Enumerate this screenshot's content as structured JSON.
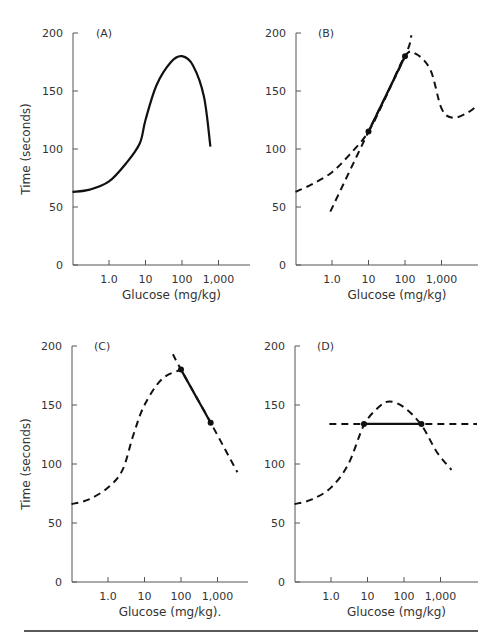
{
  "chart_data": [
    {
      "type": "line",
      "panel": "A",
      "title": "(A)",
      "xlabel": "Glucose (mg/kg)",
      "ylabel": "Time (seconds)",
      "xscale": "log",
      "xticks": [
        "1.0",
        "10",
        "100",
        "1,000"
      ],
      "yticks": [
        0,
        50,
        100,
        150,
        200
      ],
      "ylim": [
        0,
        200
      ],
      "grid": false,
      "series": [
        {
          "name": "dose-response",
          "style": "solid",
          "x": [
            0.1,
            0.3,
            1.0,
            3.0,
            7.0,
            10,
            20,
            50,
            100,
            200,
            400,
            600
          ],
          "y": [
            63,
            65,
            72,
            88,
            105,
            125,
            155,
            175,
            180,
            172,
            145,
            102
          ]
        }
      ]
    },
    {
      "type": "line",
      "panel": "B",
      "title": "(B)",
      "xlabel": "Glucose (mg/kg)",
      "ylabel": "",
      "xscale": "log",
      "xticks": [
        "1.0",
        "10",
        "100",
        "1,000"
      ],
      "yticks": [
        0,
        50,
        100,
        150,
        200
      ],
      "ylim": [
        0,
        200
      ],
      "grid": false,
      "series": [
        {
          "name": "curve",
          "style": "dashed",
          "x": [
            0.1,
            0.3,
            1.0,
            3.0,
            10,
            30,
            100,
            200,
            500,
            1000,
            2000,
            5000,
            10000
          ],
          "y": [
            63,
            70,
            80,
            95,
            115,
            145,
            180,
            182,
            168,
            135,
            127,
            131,
            138
          ]
        },
        {
          "name": "tangent-extension",
          "style": "dashed",
          "x": [
            0.9,
            10,
            100,
            150
          ],
          "y": [
            46,
            115,
            180,
            198
          ]
        },
        {
          "name": "segment",
          "style": "solid",
          "x": [
            10,
            100
          ],
          "y": [
            115,
            180
          ]
        }
      ],
      "points": [
        {
          "x": 10,
          "y": 115
        },
        {
          "x": 100,
          "y": 180
        }
      ]
    },
    {
      "type": "line",
      "panel": "C",
      "title": "(C)",
      "xlabel": "Glucose (mg/kg).",
      "ylabel": "Time (seconds)",
      "xscale": "log",
      "xticks": [
        "1.0",
        "10",
        "100",
        "1,000"
      ],
      "yticks": [
        0,
        50,
        100,
        150,
        200
      ],
      "ylim": [
        0,
        200
      ],
      "grid": false,
      "series": [
        {
          "name": "curve",
          "style": "dashed",
          "x": [
            0.1,
            0.3,
            1.0,
            2.5,
            5,
            10,
            30,
            100
          ],
          "y": [
            66,
            70,
            80,
            95,
            125,
            150,
            172,
            180
          ]
        },
        {
          "name": "tangent-extension",
          "style": "dashed",
          "x": [
            60,
            100,
            650,
            3500
          ],
          "y": [
            193,
            180,
            135,
            93
          ]
        },
        {
          "name": "segment",
          "style": "solid",
          "x": [
            100,
            650
          ],
          "y": [
            180,
            135
          ]
        }
      ],
      "points": [
        {
          "x": 100,
          "y": 180
        },
        {
          "x": 650,
          "y": 135
        }
      ]
    },
    {
      "type": "line",
      "panel": "D",
      "title": "(D)",
      "xlabel": "Glucose (mg/kg)",
      "ylabel": "",
      "xscale": "log",
      "xticks": [
        "1.0",
        "10",
        "100",
        "1,000"
      ],
      "yticks": [
        0,
        50,
        100,
        150,
        200
      ],
      "ylim": [
        0,
        200
      ],
      "grid": false,
      "series": [
        {
          "name": "curve",
          "style": "dashed",
          "x": [
            0.1,
            0.3,
            1.0,
            3.0,
            8,
            20,
            40,
            100,
            300,
            800,
            2000
          ],
          "y": [
            66,
            70,
            80,
            100,
            133,
            148,
            153,
            148,
            133,
            110,
            95
          ]
        },
        {
          "name": "horizontal-line",
          "style": "dashed",
          "x": [
            0.9,
            10000
          ],
          "y": [
            134,
            134
          ]
        },
        {
          "name": "segment",
          "style": "solid",
          "x": [
            8,
            300
          ],
          "y": [
            134,
            134
          ]
        }
      ],
      "points": [
        {
          "x": 8,
          "y": 134
        },
        {
          "x": 300,
          "y": 134
        }
      ]
    }
  ]
}
